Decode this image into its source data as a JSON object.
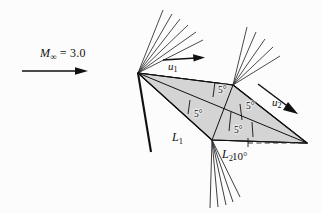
{
  "figure": {
    "background_color": "#fcfcfc",
    "airfoil_fill": "#d4d4d4",
    "line_color": "#111111"
  },
  "freestream": {
    "symbol": "M",
    "subscript": "∞",
    "equals": " = 3.0",
    "full_label": "M∞ = 3.0",
    "arrow_name": "freestream-direction-arrow"
  },
  "velocity_labels": {
    "upper": {
      "symbol": "u",
      "subscript": "1",
      "full": "u1"
    },
    "lower": {
      "symbol": "u",
      "subscript": "2",
      "full": "u2"
    }
  },
  "surface_labels": {
    "front_lower": {
      "symbol": "L",
      "subscript": "1",
      "full": "L1"
    },
    "rear_lower": {
      "symbol": "L",
      "subscript": "2",
      "full": "L2"
    }
  },
  "angles": {
    "wedge_half_angles": [
      "5°",
      "5°",
      "5°",
      "5°"
    ],
    "angle_of_attack": "10°",
    "upper_front": "5°",
    "upper_rear": "5°",
    "lower_front": "5°",
    "lower_rear": "5°"
  },
  "wave_features": {
    "leading_edge_upper": "expansion-fan",
    "leading_edge_lower": "oblique-shock",
    "midchord_upper": "expansion-fan",
    "midchord_lower": "expansion-fan",
    "trailing_edge": "converging-waves",
    "reference_line": "dashed-chord-reference"
  }
}
